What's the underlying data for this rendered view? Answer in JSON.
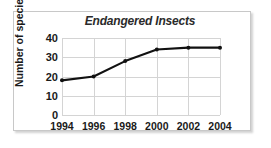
{
  "chart_data": {
    "type": "line",
    "title": "Endangered Insects",
    "xlabel": "",
    "ylabel": "Number of species",
    "x": [
      1994,
      1996,
      1998,
      2000,
      2002,
      2004
    ],
    "categories": [
      "1994",
      "1996",
      "1998",
      "2000",
      "2002",
      "2004"
    ],
    "values": [
      18,
      20,
      28,
      34,
      35,
      35
    ],
    "series": [
      {
        "name": "Number of species",
        "values": [
          18,
          20,
          28,
          34,
          35,
          35
        ]
      }
    ],
    "ylim": [
      0,
      40
    ],
    "yticks": [
      0,
      10,
      20,
      30,
      40
    ],
    "ytick_labels": [
      "0",
      "10",
      "20",
      "30",
      "40"
    ],
    "xlim": [
      1994,
      2004
    ],
    "xticks": [
      1994,
      1996,
      1998,
      2000,
      2002,
      2004
    ],
    "xtick_labels": [
      "1994",
      "1996",
      "1998",
      "2000",
      "2002",
      "2004"
    ],
    "grid": true,
    "legend": false,
    "legend_position": "none",
    "line_color": "#111111",
    "marker": "circle",
    "marker_color": "#111111",
    "grid_color": "#d4d4d4",
    "frame_color": "#c8c8c8",
    "background_color": "#ffffff"
  }
}
